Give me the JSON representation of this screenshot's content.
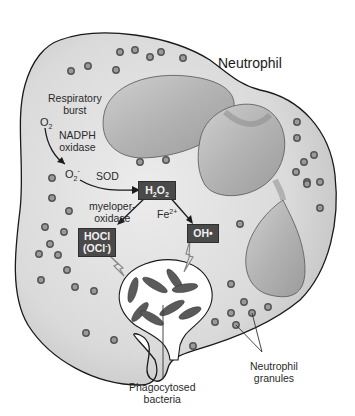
{
  "title": "Neutrophil",
  "labels": {
    "respiratory_burst": [
      "Respiratory",
      "burst"
    ],
    "o2": "O",
    "o2_sub": "2",
    "nadph_oxidase": [
      "NADPH",
      "oxidase"
    ],
    "superoxide": "O",
    "superoxide_sub": "2",
    "superoxide_sup": "-",
    "sod": "SOD",
    "myeloperoxidase": [
      "myeloper-",
      "oxidase"
    ],
    "fe2": "Fe",
    "fe2_sup": "2+",
    "phagocytosed_bacteria": [
      "Phagocytosed",
      "bacteria"
    ],
    "neutrophil_granules": [
      "Neutrophil",
      "granules"
    ]
  },
  "boxes": {
    "h2o2": {
      "main": "H",
      "sub1": "2",
      "mid": "O",
      "sub2": "2"
    },
    "hocl": {
      "line1": "HOCl",
      "line2_pre": "(OCl",
      "line2_sup": "-",
      "line2_post": ")"
    },
    "oh": "OH•"
  },
  "colors": {
    "cytoplasm": "#d9d9d9",
    "nucleus": "#b8b8b8",
    "box": "#4a4a4a",
    "bacteria": "#5a5a5a",
    "outline": "#1a1a1a"
  }
}
